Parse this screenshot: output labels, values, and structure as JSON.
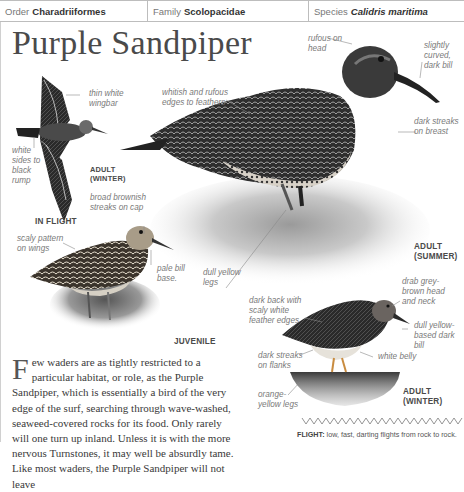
{
  "header": {
    "order": {
      "label": "Order",
      "value": "Charadriiformes"
    },
    "family": {
      "label": "Family",
      "value": "Scolopacidae"
    },
    "species": {
      "label": "Species",
      "value": "Calidris maritima"
    }
  },
  "title": "Purple Sandpiper",
  "illustrations": {
    "in_flight": {
      "caption": "IN FLIGHT",
      "stage_line1": "ADULT",
      "stage_line2": "(WINTER)",
      "annotations": {
        "wingbar": [
          "thin white",
          "wingbar"
        ],
        "rump": [
          "white",
          "sides to",
          "black",
          "rump"
        ]
      }
    },
    "adult_summer": {
      "stage_line1": "ADULT",
      "stage_line2": "(SUMMER)",
      "annotations": {
        "head": [
          "rufous on",
          "head"
        ],
        "bill": [
          "slightly",
          "curved,",
          "dark bill"
        ],
        "feathers": [
          "whitish and rufous",
          "edges to feathers"
        ],
        "breast": [
          "dark streaks",
          "on breast"
        ],
        "legs": [
          "dull yellow",
          "legs"
        ]
      }
    },
    "juvenile": {
      "stage": "JUVENILE",
      "annotations": {
        "cap": [
          "broad brownish",
          "streaks on cap"
        ],
        "wings": [
          "scaly pattern",
          "on wings"
        ],
        "bill": [
          "pale bill",
          "base."
        ]
      }
    },
    "adult_winter": {
      "stage_line1": "ADULT",
      "stage_line2": "(WINTER)",
      "annotations": {
        "head": [
          "drab grey-",
          "brown head",
          "and neck"
        ],
        "back": [
          "dark back with",
          "scaly white",
          "feather edges"
        ],
        "bill": [
          "dull yellow-",
          "based dark",
          "bill"
        ],
        "flanks": [
          "dark streaks",
          "on flanks"
        ],
        "belly": [
          "white belly"
        ],
        "legs": [
          "orange-",
          "yellow legs"
        ]
      }
    }
  },
  "body": {
    "dropcap": "F",
    "text": "ew waders are as tightly restricted to a particular habitat, or role, as the Purple Sandpiper, which is essentially a bird of the very edge of the surf, searching through wave-washed, seaweed-covered rocks for its food. Only rarely will one turn up inland. Unless it is with the more nervous Turnstones, it may well be absurdly tame. Like most waders, the Purple Sandpiper will not leave"
  },
  "flight": {
    "label": "FLIGHT:",
    "text": " low, fast, darting flights from rock to rock."
  },
  "colors": {
    "rule": "#bdbdbd",
    "annotation": "#7a7a7a",
    "title": "#4a4a4a"
  }
}
